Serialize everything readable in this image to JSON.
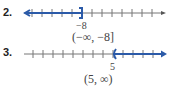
{
  "problems": [
    {
      "number": "2.",
      "endpoint_label": "−8",
      "interval": "(−∞, −8]",
      "direction": "left",
      "endpoint_type": "closed-bracket"
    },
    {
      "number": "3.",
      "endpoint_label": "5",
      "interval": "(5, ∞)",
      "direction": "right",
      "endpoint_type": "open-paren"
    }
  ],
  "colors": {
    "shade": "#2b5aa8",
    "axis": "#777777"
  }
}
